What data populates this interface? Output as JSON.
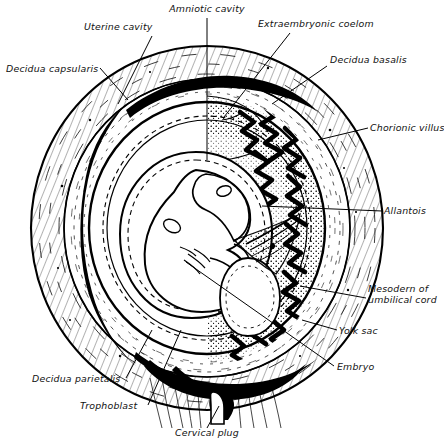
{
  "figure": {
    "background": "#ffffff",
    "ink": "#000000",
    "width": 444,
    "height": 443
  },
  "labels": [
    {
      "id": "amniotic-cavity",
      "text": "Amniotic cavity",
      "x": 207,
      "y": 12,
      "anchor": "middle",
      "leader": [
        [
          207,
          18
        ],
        [
          207,
          160
        ]
      ]
    },
    {
      "id": "uterine-cavity",
      "text": "Uterine cavity",
      "x": 84,
      "y": 30,
      "anchor": "start",
      "leader": [
        [
          152,
          36
        ],
        [
          118,
          104
        ]
      ]
    },
    {
      "id": "extraembryonic-coelom",
      "text": "Extraembryonic  coelom",
      "x": 258,
      "y": 27,
      "anchor": "start",
      "leader": [
        [
          290,
          33
        ],
        [
          224,
          117
        ]
      ]
    },
    {
      "id": "decidua-capsularis",
      "text": "Decidua capsularis",
      "x": 6,
      "y": 72,
      "anchor": "start",
      "leader": [
        [
          100,
          68
        ],
        [
          128,
          100
        ]
      ]
    },
    {
      "id": "decidua-basalis",
      "text": "Decidua basalis",
      "x": 330,
      "y": 63,
      "anchor": "start",
      "leader": [
        [
          327,
          66
        ],
        [
          272,
          104
        ]
      ]
    },
    {
      "id": "chorionic-villus",
      "text": "Chorionic villus",
      "x": 370,
      "y": 131,
      "anchor": "start",
      "leader": [
        [
          368,
          128
        ],
        [
          318,
          140
        ]
      ]
    },
    {
      "id": "allantois",
      "text": "Allantois",
      "x": 384,
      "y": 214,
      "anchor": "start",
      "leader": [
        [
          382,
          211
        ],
        [
          262,
          206
        ]
      ]
    },
    {
      "id": "mesoderm-umbilical-cord",
      "text": "Mesodern of",
      "text2": "umbilical cord",
      "x": 368,
      "y": 296,
      "anchor": "start",
      "leader": [
        [
          366,
          298
        ],
        [
          300,
          286
        ]
      ]
    },
    {
      "id": "yolk-sac",
      "text": "Yolk sac",
      "x": 339,
      "y": 334,
      "anchor": "start",
      "leader": [
        [
          337,
          330
        ],
        [
          302,
          320
        ]
      ]
    },
    {
      "id": "embryo",
      "text": "Embryo",
      "x": 337,
      "y": 370,
      "anchor": "start",
      "leader": [
        [
          334,
          366
        ],
        [
          186,
          262
        ]
      ]
    },
    {
      "id": "decidua-parietalis",
      "text": "Decidua parietalis",
      "x": 32,
      "y": 382,
      "anchor": "start",
      "leader": [
        [
          126,
          378
        ],
        [
          152,
          330
        ]
      ]
    },
    {
      "id": "trophoblast",
      "text": "Trophoblast",
      "x": 80,
      "y": 409,
      "anchor": "start",
      "leader": [
        [
          148,
          405
        ],
        [
          181,
          330
        ]
      ]
    },
    {
      "id": "cervical-plug",
      "text": "Cervical plug",
      "x": 207,
      "y": 436,
      "anchor": "middle",
      "leader": [
        [
          207,
          428
        ],
        [
          219,
          406
        ]
      ]
    }
  ],
  "structures": {
    "uterine_wall": "myometrium outer oval",
    "decidua_capsularis": "thin layer over embryo",
    "uterine_cavity": "black crescent slit",
    "chorion": "dashed inner membrane",
    "amnion": "inner dashed sac",
    "embryo": "curled embryo, head upper-left, limb bud lower",
    "chorionic_villi": "branching villi on right, decidua basalis",
    "yolk_sac": "pear-shaped sac below embryo",
    "allantois": "stalk into umbilical cord",
    "cervical_canal": "black wedge at base",
    "cervical_plug": "white plug within canal"
  }
}
